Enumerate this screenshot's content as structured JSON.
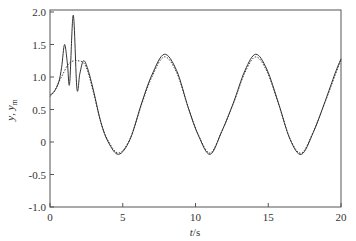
{
  "chart_data": {
    "type": "line",
    "title": "",
    "xlabel": "t/s",
    "xlabel_italic": "t",
    "xlabel_unit": "/s",
    "ylabel": "y, y_m",
    "xlim": [
      0,
      20
    ],
    "ylim": [
      -1.0,
      2.0
    ],
    "xticks": [
      0,
      5,
      10,
      15,
      20
    ],
    "xtick_labels": [
      "0",
      "5",
      "10",
      "15",
      "20"
    ],
    "yticks": [
      -1.0,
      -0.5,
      0,
      0.5,
      1.0,
      1.5,
      2.0
    ],
    "ytick_labels": [
      "-1.0",
      "-0.5",
      "0",
      "0.5",
      "1.0",
      "1.5",
      "2.0"
    ],
    "grid": false,
    "legend": "none",
    "series": [
      {
        "name": "y",
        "style": "solid",
        "color": "#333333",
        "x": [
          0,
          0.3,
          0.6,
          0.8,
          1.0,
          1.2,
          1.35,
          1.6,
          1.85,
          2.05,
          2.3,
          2.6,
          3.0,
          3.5,
          4.0,
          4.71,
          5.5,
          6.3,
          7.0,
          7.85,
          8.7,
          9.5,
          10.2,
          11.0,
          11.8,
          12.6,
          13.4,
          14.14,
          14.9,
          15.7,
          16.5,
          17.28,
          18.1,
          18.9,
          19.6,
          20.0
        ],
        "values": [
          0.72,
          0.78,
          0.92,
          1.15,
          1.5,
          1.2,
          0.9,
          1.95,
          0.82,
          1.05,
          1.25,
          1.12,
          0.78,
          0.3,
          0.0,
          -0.19,
          0.04,
          0.6,
          1.03,
          1.35,
          1.1,
          0.53,
          0.1,
          -0.19,
          0.16,
          0.6,
          1.1,
          1.35,
          1.12,
          0.6,
          0.04,
          -0.19,
          0.15,
          0.62,
          1.06,
          1.28
        ]
      },
      {
        "name": "y_m",
        "style": "dashed",
        "color": "#333333",
        "x": [
          0,
          0.3,
          0.6,
          0.9,
          1.2,
          1.5,
          1.9,
          2.3,
          2.6,
          3.0,
          3.5,
          4.0,
          4.71,
          5.5,
          6.3,
          7.0,
          7.85,
          8.7,
          9.5,
          10.2,
          11.0,
          11.8,
          12.6,
          13.4,
          14.14,
          14.9,
          15.7,
          16.5,
          17.28,
          18.1,
          18.9,
          19.6,
          20.0
        ],
        "values": [
          0.7,
          0.78,
          0.92,
          1.05,
          1.18,
          1.24,
          1.25,
          1.22,
          1.08,
          0.75,
          0.3,
          0.02,
          -0.17,
          0.05,
          0.58,
          1.0,
          1.31,
          1.07,
          0.53,
          0.11,
          -0.17,
          0.16,
          0.59,
          1.07,
          1.31,
          1.09,
          0.59,
          0.05,
          -0.17,
          0.16,
          0.61,
          1.03,
          1.26
        ]
      }
    ]
  },
  "layout": {
    "plot_left": 50,
    "plot_right": 341,
    "plot_top": 12,
    "plot_bottom": 207,
    "frame_top": 10
  }
}
